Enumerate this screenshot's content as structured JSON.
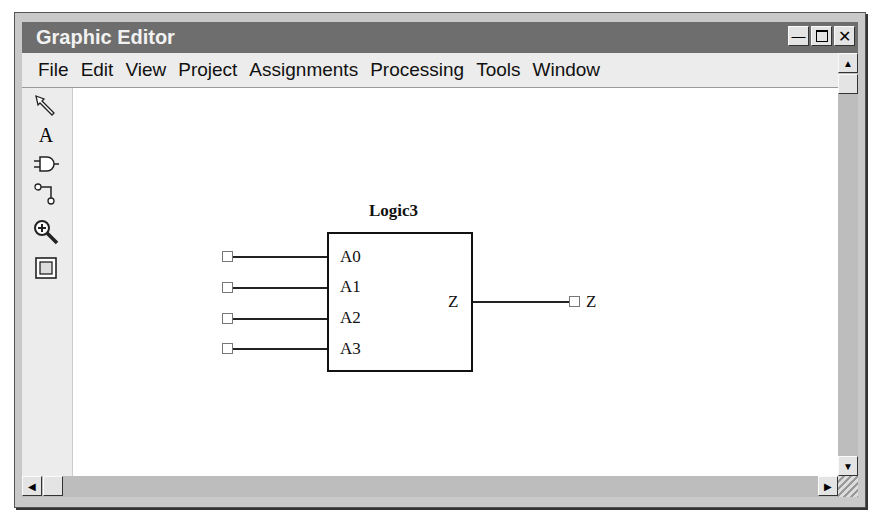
{
  "window": {
    "title": "Graphic Editor",
    "controls": [
      "minimize",
      "maximize",
      "close"
    ]
  },
  "menu": [
    "File",
    "Edit",
    "View",
    "Project",
    "Assignments",
    "Processing",
    "Tools",
    "Window"
  ],
  "toolbar": [
    {
      "name": "selection-tool",
      "icon": "arrow-pointer-icon"
    },
    {
      "name": "text-tool",
      "icon": "text-icon",
      "label": "A"
    },
    {
      "name": "symbol-tool",
      "icon": "and-gate-icon"
    },
    {
      "name": "wire-tool",
      "icon": "orthogonal-wire-icon"
    },
    {
      "name": "zoom-tool",
      "icon": "zoom-in-icon"
    },
    {
      "name": "full-screen-tool",
      "icon": "full-screen-icon"
    }
  ],
  "schematic": {
    "block": {
      "name": "Logic3",
      "inputs": [
        "A0",
        "A1",
        "A2",
        "A3"
      ],
      "output": "Z"
    },
    "output_pin": "Z"
  }
}
